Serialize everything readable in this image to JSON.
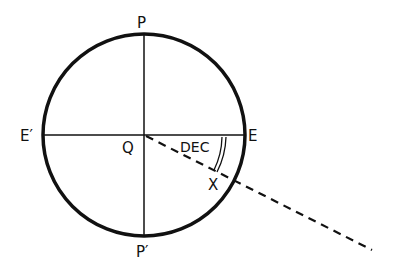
{
  "diagram": {
    "type": "celestial-sphere-declination",
    "labels": {
      "pole_north": "P",
      "pole_south": "P′",
      "east": "E",
      "west": "E′",
      "center": "Q",
      "angle": "DEC",
      "point": "X"
    },
    "colors": {
      "stroke": "#111111",
      "background": "#ffffff"
    }
  }
}
